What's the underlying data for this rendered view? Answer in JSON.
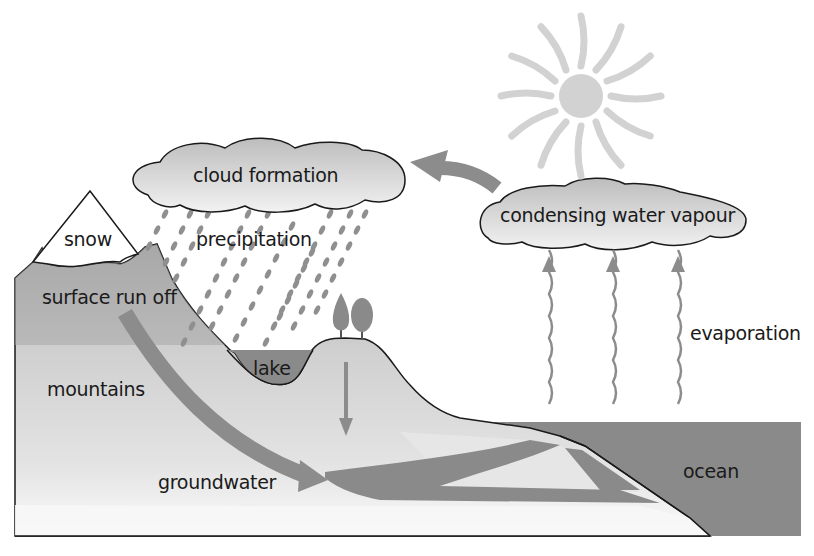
{
  "diagram": {
    "title": "",
    "type": "water cycle",
    "labels": {
      "cloud_formation": "cloud formation",
      "condensing": "condensing water vapour",
      "snow": "snow",
      "precipitation": "precipitation",
      "surface_run_off": "surface run off",
      "lake": "lake",
      "mountains": "mountains",
      "evaporation": "evaporation",
      "groundwater": "groundwater",
      "ocean": "ocean"
    },
    "elements": [
      {
        "name": "sun",
        "icon": "sun-icon"
      },
      {
        "name": "cloud formation",
        "icon": "cloud-icon"
      },
      {
        "name": "condensing water vapour",
        "icon": "cloud-icon"
      },
      {
        "name": "precipitation",
        "icon": "rain-drops"
      },
      {
        "name": "evaporation",
        "icon": "wavy-up-arrows",
        "count": 3
      },
      {
        "name": "trees",
        "icon": "tree-icon",
        "count": 2
      },
      {
        "name": "infiltration",
        "icon": "down-arrow"
      },
      {
        "name": "surface run off",
        "icon": "curved-arrow"
      },
      {
        "name": "groundwater flow",
        "icon": "forked-arrow"
      },
      {
        "name": "vapour transport",
        "icon": "curved-arrow-left"
      }
    ],
    "colors": {
      "land": "#d4d4d4",
      "land_dark": "#a8a8a8",
      "water": "#8a8a8a",
      "arrow": "#8c8c8c",
      "sun": "#d2d2d2",
      "cloud": "#dcdcdc",
      "outline": "#1a1a1a",
      "rain": "#8f8f8f"
    }
  }
}
